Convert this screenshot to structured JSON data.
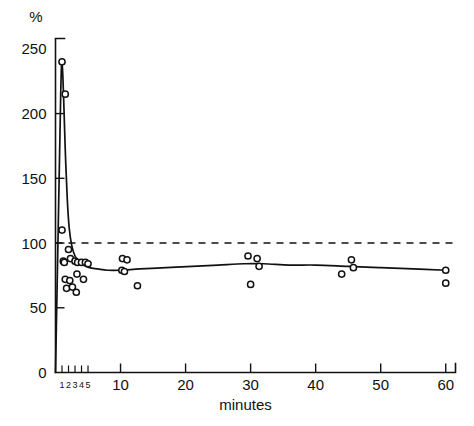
{
  "chart_data": {
    "type": "scatter",
    "title": "",
    "subtitle": "",
    "xlabel": "minutes",
    "ylabel": "",
    "unit_label": "%",
    "xlim": [
      0,
      61.5
    ],
    "ylim": [
      0,
      258
    ],
    "grid": false,
    "legend": null,
    "x_ticks": [
      1,
      2,
      3,
      4,
      5,
      10,
      20,
      30,
      40,
      50,
      60
    ],
    "x_tick_labels": [
      "1",
      "2",
      "3",
      "4",
      "5",
      "10",
      "20",
      "30",
      "40",
      "50",
      "60"
    ],
    "x_minor_ticks": [
      1,
      2,
      3,
      4,
      5
    ],
    "y_ticks": [
      0,
      50,
      100,
      150,
      200,
      250
    ],
    "y_tick_labels": [
      "0",
      "50",
      "100",
      "150",
      "200",
      "250"
    ],
    "reference_line": {
      "y": 100,
      "style": "dashed",
      "label": ""
    },
    "series": [
      {
        "name": "observations",
        "marker": "open-circle",
        "points": [
          [
            1.0,
            240
          ],
          [
            1.5,
            215
          ],
          [
            1.0,
            110
          ],
          [
            1.2,
            86
          ],
          [
            1.35,
            85
          ],
          [
            2.0,
            95
          ],
          [
            2.3,
            88
          ],
          [
            1.5,
            72
          ],
          [
            2.2,
            71
          ],
          [
            1.7,
            65
          ],
          [
            2.6,
            66
          ],
          [
            3.0,
            86
          ],
          [
            3.4,
            85
          ],
          [
            3.3,
            76
          ],
          [
            4.0,
            85
          ],
          [
            4.3,
            72
          ],
          [
            3.2,
            62
          ],
          [
            4.6,
            85
          ],
          [
            5.0,
            84
          ],
          [
            10.3,
            88
          ],
          [
            11.0,
            87
          ],
          [
            10.2,
            79
          ],
          [
            10.6,
            78
          ],
          [
            12.6,
            67
          ],
          [
            29.6,
            90
          ],
          [
            31.0,
            88
          ],
          [
            31.3,
            82
          ],
          [
            30.0,
            68
          ],
          [
            45.5,
            87
          ],
          [
            45.8,
            81
          ],
          [
            44.0,
            76
          ],
          [
            60.0,
            79
          ],
          [
            60.0,
            69
          ]
        ]
      }
    ],
    "fit_curve": {
      "name": "fitted-trend",
      "points": [
        [
          0.0,
          0
        ],
        [
          0.45,
          120
        ],
        [
          0.8,
          215
        ],
        [
          1.0,
          240
        ],
        [
          1.25,
          212
        ],
        [
          1.5,
          172
        ],
        [
          1.8,
          135
        ],
        [
          2.1,
          112
        ],
        [
          2.5,
          98
        ],
        [
          3.0,
          90
        ],
        [
          3.6,
          86
        ],
        [
          4.3,
          83
        ],
        [
          5.2,
          81
        ],
        [
          6.5,
          80
        ],
        [
          8.0,
          79
        ],
        [
          10.0,
          79
        ],
        [
          13.0,
          80
        ],
        [
          17.0,
          81
        ],
        [
          21.0,
          82
        ],
        [
          25.0,
          83
        ],
        [
          29.0,
          84
        ],
        [
          32.0,
          84
        ],
        [
          36.0,
          83
        ],
        [
          40.0,
          83
        ],
        [
          45.0,
          82
        ],
        [
          50.0,
          81
        ],
        [
          55.0,
          80
        ],
        [
          60.0,
          79
        ]
      ]
    }
  }
}
